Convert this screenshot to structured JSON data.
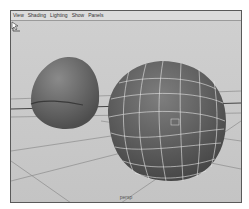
{
  "menubar": {
    "items": [
      {
        "label": "View"
      },
      {
        "label": "Shading"
      },
      {
        "label": "Lighting"
      },
      {
        "label": "Show"
      },
      {
        "label": "Panels"
      }
    ]
  },
  "viewport": {
    "camera_label": "persp",
    "objects": [
      {
        "name": "left-sphere",
        "display": "smooth shaded"
      },
      {
        "name": "right-sphere",
        "display": "smooth shaded with wireframe"
      }
    ],
    "axis_indicator": {
      "labels": [
        "Y",
        "X"
      ]
    }
  },
  "colors": {
    "background": "#c8c8c8",
    "menubar": "#dcdcdc",
    "object_shade": "#6e6e6e",
    "wireframe": "#e8e8e8",
    "grid": "#8a8a8a"
  }
}
